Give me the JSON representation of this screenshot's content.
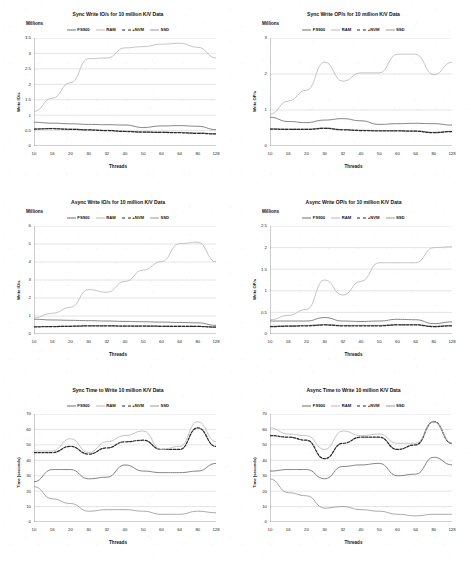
{
  "page": {
    "background": "#ffffff",
    "layout": "2 columns x 3 rows of line charts"
  },
  "series_styles": {
    "FS900": {
      "color": "#6f6f6f",
      "dash": "none"
    },
    "RAM": {
      "color": "#b9b9b9",
      "dash": "none"
    },
    "+NVM": {
      "color": "#2b2b2b",
      "dash": "dashed"
    },
    "SSD": {
      "color": "#9a9a9a",
      "dash": "none"
    }
  },
  "legend_labels": [
    "FS900",
    "RAM",
    "+NVM",
    "SSD"
  ],
  "threads": [
    "10",
    "16",
    "20",
    "30",
    "32",
    "40",
    "50",
    "60",
    "64",
    "80",
    "128"
  ],
  "chart_data": [
    {
      "id": "sync-write-ios",
      "type": "line",
      "title": "Sync Write IO/s for 10 million K/V Data",
      "units_note": "Millions",
      "xlabel": "Threads",
      "ylabel": "Write IO/s",
      "categories": [
        "10",
        "16",
        "20",
        "30",
        "32",
        "40",
        "50",
        "60",
        "64",
        "80",
        "128"
      ],
      "ylim": [
        0,
        3.5
      ],
      "yticks": [
        0,
        0.5,
        1,
        1.5,
        2,
        2.5,
        3,
        3.5
      ],
      "grid": true,
      "legend_position": "top-center",
      "series": [
        {
          "name": "FS900",
          "values": [
            0.77,
            0.74,
            0.72,
            0.7,
            0.69,
            0.68,
            0.6,
            0.65,
            0.66,
            0.64,
            0.53
          ]
        },
        {
          "name": "RAM",
          "values": [
            1.12,
            1.55,
            2.05,
            2.83,
            2.85,
            3.18,
            3.22,
            3.3,
            3.33,
            3.2,
            2.85
          ]
        },
        {
          "name": "+NVM",
          "values": [
            0.55,
            0.56,
            0.54,
            0.52,
            0.5,
            0.47,
            0.45,
            0.44,
            0.43,
            0.41,
            0.39
          ]
        },
        {
          "name": "SSD",
          "values": [
            0.56,
            0.57,
            0.55,
            0.53,
            0.51,
            0.48,
            0.46,
            0.45,
            0.44,
            0.42,
            0.4
          ]
        }
      ]
    },
    {
      "id": "sync-write-ops",
      "type": "line",
      "title": "Sync Write OP/s for 10 million K/V Data",
      "units_note": "Millions",
      "xlabel": "Threads",
      "ylabel": "Write OP/s",
      "categories": [
        "10",
        "16",
        "20",
        "30",
        "32",
        "40",
        "50",
        "60",
        "64",
        "80",
        "128"
      ],
      "ylim": [
        0,
        3
      ],
      "yticks": [
        0,
        1,
        2,
        3
      ],
      "grid": true,
      "legend_position": "top-center",
      "series": [
        {
          "name": "FS900",
          "values": [
            0.8,
            0.68,
            0.65,
            0.72,
            0.76,
            0.7,
            0.6,
            0.62,
            0.63,
            0.62,
            0.58
          ]
        },
        {
          "name": "RAM",
          "values": [
            0.88,
            1.25,
            1.55,
            2.33,
            1.8,
            2.03,
            2.03,
            2.55,
            2.55,
            1.98,
            2.33
          ]
        },
        {
          "name": "+NVM",
          "values": [
            0.47,
            0.46,
            0.46,
            0.49,
            0.45,
            0.43,
            0.42,
            0.42,
            0.41,
            0.37,
            0.4
          ]
        },
        {
          "name": "SSD",
          "values": [
            0.48,
            0.47,
            0.47,
            0.5,
            0.46,
            0.44,
            0.43,
            0.43,
            0.42,
            0.38,
            0.41
          ]
        }
      ]
    },
    {
      "id": "async-write-ios",
      "type": "line",
      "title": "Async Write IO/s for 10 million K/V Data",
      "units_note": "Millions",
      "xlabel": "Threads",
      "ylabel": "Write IO/s",
      "categories": [
        "10",
        "16",
        "20",
        "30",
        "32",
        "40",
        "50",
        "60",
        "64",
        "80",
        "128"
      ],
      "ylim": [
        0,
        6
      ],
      "yticks": [
        0,
        1,
        2,
        3,
        4,
        5,
        6
      ],
      "grid": true,
      "legend_position": "top-center",
      "series": [
        {
          "name": "FS900",
          "values": [
            0.82,
            0.78,
            0.76,
            0.74,
            0.72,
            0.7,
            0.68,
            0.66,
            0.64,
            0.62,
            0.48
          ]
        },
        {
          "name": "RAM",
          "values": [
            0.9,
            1.15,
            1.48,
            2.47,
            2.32,
            2.92,
            3.55,
            4.02,
            5.02,
            5.1,
            4.0
          ]
        },
        {
          "name": "+NVM",
          "values": [
            0.4,
            0.41,
            0.43,
            0.45,
            0.45,
            0.44,
            0.44,
            0.43,
            0.43,
            0.42,
            0.38
          ]
        },
        {
          "name": "SSD",
          "values": [
            0.41,
            0.42,
            0.44,
            0.46,
            0.46,
            0.45,
            0.45,
            0.44,
            0.44,
            0.43,
            0.39
          ]
        }
      ]
    },
    {
      "id": "async-write-ops",
      "type": "line",
      "title": "Async Write OP/s for 10 million K/V Data",
      "units_note": "Millions",
      "xlabel": "Threads",
      "ylabel": "Write OP/s",
      "categories": [
        "10",
        "16",
        "20",
        "30",
        "32",
        "40",
        "50",
        "60",
        "64",
        "80",
        "128"
      ],
      "ylim": [
        0,
        2.5
      ],
      "yticks": [
        0,
        0.5,
        1,
        1.5,
        2,
        2.5
      ],
      "grid": true,
      "legend_position": "top-center",
      "series": [
        {
          "name": "FS900",
          "values": [
            0.3,
            0.3,
            0.3,
            0.38,
            0.3,
            0.29,
            0.3,
            0.34,
            0.33,
            0.24,
            0.28
          ]
        },
        {
          "name": "RAM",
          "values": [
            0.33,
            0.43,
            0.57,
            1.25,
            0.9,
            1.22,
            1.65,
            1.65,
            1.65,
            2.0,
            2.02
          ]
        },
        {
          "name": "+NVM",
          "values": [
            0.17,
            0.18,
            0.19,
            0.21,
            0.19,
            0.19,
            0.19,
            0.21,
            0.21,
            0.17,
            0.19
          ]
        },
        {
          "name": "SSD",
          "values": [
            0.18,
            0.19,
            0.2,
            0.22,
            0.2,
            0.2,
            0.2,
            0.22,
            0.22,
            0.18,
            0.2
          ]
        }
      ]
    },
    {
      "id": "sync-time-to-write",
      "type": "line",
      "title": "Sync Time to Write 10 million K/V Data",
      "units_note": "",
      "xlabel": "Threads",
      "ylabel": "Time (seconds)",
      "categories": [
        "10",
        "16",
        "20",
        "30",
        "32",
        "40",
        "50",
        "60",
        "64",
        "80",
        "128"
      ],
      "ylim": [
        0,
        70
      ],
      "yticks": [
        0,
        10,
        20,
        30,
        40,
        50,
        60,
        70
      ],
      "grid": true,
      "legend_position": "top-center",
      "series": [
        {
          "name": "FS900",
          "values": [
            26,
            34,
            34,
            28,
            29,
            37,
            33,
            32,
            32,
            33,
            38
          ]
        },
        {
          "name": "RAM",
          "values": [
            46,
            46,
            54,
            45,
            52,
            56,
            59,
            47,
            49,
            65,
            52
          ]
        },
        {
          "name": "+NVM",
          "values": [
            45,
            45,
            49,
            44,
            48,
            52,
            53,
            47,
            47,
            61,
            49
          ]
        },
        {
          "name": "SSD",
          "values": [
            23,
            15,
            12,
            7,
            8,
            8,
            7,
            5,
            5,
            7,
            6
          ]
        }
      ]
    },
    {
      "id": "async-time-to-write",
      "type": "line",
      "title": "Async Time to Write 10 million K/V Data",
      "units_note": "",
      "xlabel": "Threads",
      "ylabel": "Time (seconds)",
      "categories": [
        "10",
        "16",
        "20",
        "30",
        "32",
        "40",
        "50",
        "60",
        "64",
        "80",
        "128"
      ],
      "ylim": [
        0,
        70
      ],
      "yticks": [
        0,
        10,
        20,
        30,
        40,
        50,
        60,
        70
      ],
      "grid": true,
      "legend_position": "top-center",
      "series": [
        {
          "name": "FS900",
          "values": [
            33,
            34,
            34,
            28,
            36,
            37,
            38,
            30,
            31,
            42,
            37
          ]
        },
        {
          "name": "RAM",
          "values": [
            61,
            57,
            56,
            47,
            59,
            56,
            57,
            51,
            51,
            65,
            51
          ]
        },
        {
          "name": "+NVM",
          "values": [
            56,
            55,
            53,
            41,
            51,
            55,
            55,
            47,
            50,
            65,
            51
          ]
        },
        {
          "name": "SSD",
          "values": [
            28,
            19,
            17,
            9,
            10,
            8,
            7,
            5,
            4,
            5,
            5
          ]
        }
      ]
    }
  ]
}
